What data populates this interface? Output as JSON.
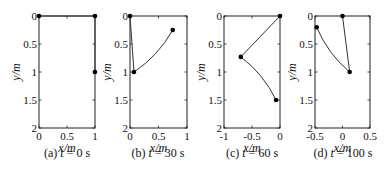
{
  "chart_data": [
    {
      "type": "line",
      "panel": "(a)",
      "caption_label": "(a)",
      "caption_var": "t",
      "caption_value": "= 0 s",
      "xlabel": "x/m",
      "ylabel": "y/m",
      "xlim": [
        0,
        1
      ],
      "ylim": [
        0,
        2
      ],
      "y_inverted": true,
      "xticks": [
        0,
        0.5,
        1
      ],
      "xtick_labels": [
        "0",
        "0.5",
        "1"
      ],
      "yticks": [
        0,
        0.5,
        1,
        1.5,
        2
      ],
      "ytick_labels": [
        "0",
        "0.5",
        "1",
        "1.5",
        "2"
      ],
      "grid": false,
      "series": [
        {
          "name": "segment-1",
          "style": "straight",
          "points": [
            [
              0,
              0
            ],
            [
              1,
              0
            ]
          ]
        },
        {
          "name": "segment-2",
          "style": "straight",
          "points": [
            [
              1,
              0
            ],
            [
              1,
              1
            ]
          ]
        }
      ],
      "markers": [
        [
          0,
          0
        ],
        [
          1,
          0
        ],
        [
          1,
          1
        ]
      ]
    },
    {
      "type": "line",
      "panel": "(b)",
      "caption_label": "(b)",
      "caption_var": "t",
      "caption_value": "= 30 s",
      "xlabel": "x/m",
      "ylabel": "y/m",
      "xlim": [
        0,
        1
      ],
      "ylim": [
        0,
        2
      ],
      "y_inverted": true,
      "xticks": [
        0,
        0.5,
        1
      ],
      "xtick_labels": [
        "0",
        "0.5",
        "1"
      ],
      "yticks": [
        0,
        0.5,
        1,
        1.5,
        2
      ],
      "ytick_labels": [
        "0",
        "0.5",
        "1",
        "1.5",
        "2"
      ],
      "grid": false,
      "series": [
        {
          "name": "segment-1",
          "style": "straight",
          "points": [
            [
              0,
              0
            ],
            [
              0.07,
              1.0
            ]
          ]
        },
        {
          "name": "segment-2",
          "style": "curved",
          "points": [
            [
              0.07,
              1.0
            ],
            [
              0.75,
              0.25
            ]
          ],
          "bend": 0.12
        }
      ],
      "markers": [
        [
          0,
          0
        ],
        [
          0.07,
          1.0
        ],
        [
          0.75,
          0.25
        ]
      ]
    },
    {
      "type": "line",
      "panel": "(c)",
      "caption_label": "(c)",
      "caption_var": "t",
      "caption_value": "= 60 s",
      "xlabel": "x/m",
      "ylabel": "y/m",
      "xlim": [
        -1,
        0
      ],
      "ylim": [
        0,
        2
      ],
      "y_inverted": true,
      "xticks": [
        -1,
        -0.5,
        0
      ],
      "xtick_labels": [
        "-1",
        "-0.5",
        "0"
      ],
      "yticks": [
        0,
        0.5,
        1,
        1.5,
        2
      ],
      "ytick_labels": [
        "0",
        "0.5",
        "1",
        "1.5",
        "2"
      ],
      "grid": false,
      "series": [
        {
          "name": "segment-1",
          "style": "straight",
          "points": [
            [
              0,
              0
            ],
            [
              -0.7,
              0.73
            ]
          ]
        },
        {
          "name": "segment-2",
          "style": "curved",
          "points": [
            [
              -0.7,
              0.73
            ],
            [
              -0.07,
              1.5
            ]
          ],
          "bend": -0.12
        }
      ],
      "markers": [
        [
          0,
          0
        ],
        [
          -0.7,
          0.73
        ],
        [
          -0.07,
          1.5
        ]
      ]
    },
    {
      "type": "line",
      "panel": "(d)",
      "caption_label": "(d)",
      "caption_var": "t",
      "caption_value": "= 100 s",
      "xlabel": "x/m",
      "ylabel": "y/m",
      "xlim": [
        -0.5,
        0.5
      ],
      "ylim": [
        0,
        2
      ],
      "y_inverted": true,
      "xticks": [
        -0.5,
        0,
        0.5
      ],
      "xtick_labels": [
        "-0.5",
        "0",
        "0.5"
      ],
      "yticks": [
        0,
        0.5,
        1,
        1.5,
        2
      ],
      "ytick_labels": [
        "0",
        "0.5",
        "1",
        "1.5",
        "2"
      ],
      "grid": false,
      "series": [
        {
          "name": "segment-1",
          "style": "straight",
          "points": [
            [
              0,
              0
            ],
            [
              0.13,
              1.0
            ]
          ]
        },
        {
          "name": "segment-2",
          "style": "curved",
          "points": [
            [
              0.13,
              1.0
            ],
            [
              -0.47,
              0.2
            ]
          ],
          "bend": -0.12
        }
      ],
      "markers": [
        [
          0,
          0
        ],
        [
          0.13,
          1.0
        ],
        [
          -0.47,
          0.2
        ]
      ]
    }
  ],
  "layout": {
    "panels": [
      {
        "left": 39,
        "top": 16,
        "width": 56,
        "height": 112
      },
      {
        "left": 130,
        "top": 16,
        "width": 57,
        "height": 112
      },
      {
        "left": 224,
        "top": 16,
        "width": 56,
        "height": 112
      },
      {
        "left": 315,
        "top": 16,
        "width": 55,
        "height": 112
      }
    ],
    "line_color": "#333333",
    "marker_color": "#000000"
  }
}
